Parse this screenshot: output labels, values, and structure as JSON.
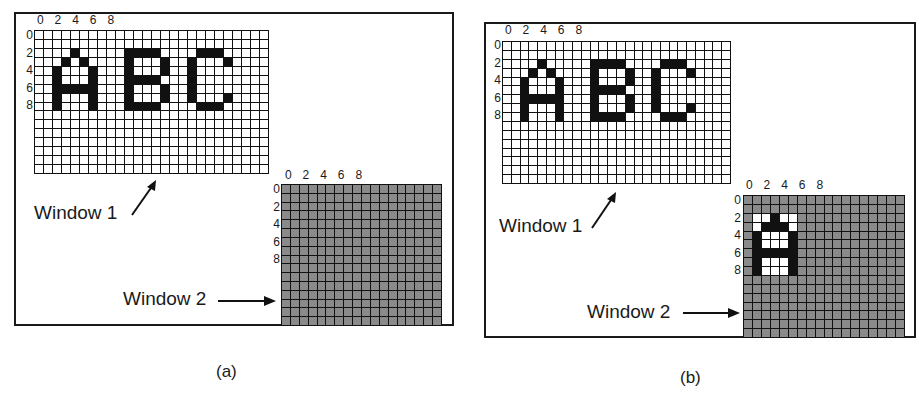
{
  "figure": {
    "panels": [
      {
        "id": "a",
        "caption": "(a)",
        "window1": {
          "label": "Window 1",
          "rows": 16,
          "cols": 26,
          "cell_color": "#ffffff",
          "x_ticks": [
            "0",
            "2",
            "4",
            "6",
            "8"
          ],
          "y_ticks": [
            "0",
            "2",
            "4",
            "6",
            "8"
          ],
          "text_shown": "ABC"
        },
        "window2": {
          "label": "Window 2",
          "rows": 16,
          "cols": 18,
          "cell_color": "#8a8a8a",
          "x_ticks": [
            "0",
            "2",
            "4",
            "6",
            "8"
          ],
          "y_ticks": [
            "0",
            "2",
            "4",
            "6",
            "8"
          ],
          "text_shown": ""
        }
      },
      {
        "id": "b",
        "caption": "(b)",
        "window1": {
          "label": "Window 1",
          "rows": 16,
          "cols": 26,
          "cell_color": "#ffffff",
          "x_ticks": [
            "0",
            "2",
            "4",
            "6",
            "8"
          ],
          "y_ticks": [
            "0",
            "2",
            "4",
            "6",
            "8"
          ],
          "text_shown": "ABC"
        },
        "window2": {
          "label": "Window 2",
          "rows": 16,
          "cols": 18,
          "cell_color": "#8a8a8a",
          "x_ticks": [
            "0",
            "2",
            "4",
            "6",
            "8"
          ],
          "y_ticks": [
            "0",
            "2",
            "4",
            "6",
            "8"
          ],
          "text_shown": "A"
        }
      }
    ],
    "glyphs": {
      "ABC_black_cells": [
        [
          2,
          4
        ],
        [
          3,
          3
        ],
        [
          3,
          5
        ],
        [
          4,
          2
        ],
        [
          4,
          6
        ],
        [
          5,
          2
        ],
        [
          5,
          6
        ],
        [
          6,
          2
        ],
        [
          6,
          3
        ],
        [
          6,
          4
        ],
        [
          6,
          5
        ],
        [
          6,
          6
        ],
        [
          7,
          2
        ],
        [
          7,
          6
        ],
        [
          8,
          2
        ],
        [
          8,
          6
        ],
        [
          2,
          10
        ],
        [
          2,
          11
        ],
        [
          2,
          12
        ],
        [
          2,
          13
        ],
        [
          3,
          10
        ],
        [
          3,
          14
        ],
        [
          4,
          10
        ],
        [
          4,
          14
        ],
        [
          5,
          10
        ],
        [
          5,
          11
        ],
        [
          5,
          12
        ],
        [
          5,
          13
        ],
        [
          6,
          10
        ],
        [
          6,
          14
        ],
        [
          7,
          10
        ],
        [
          7,
          14
        ],
        [
          8,
          10
        ],
        [
          8,
          11
        ],
        [
          8,
          12
        ],
        [
          8,
          13
        ],
        [
          2,
          18
        ],
        [
          2,
          19
        ],
        [
          2,
          20
        ],
        [
          3,
          17
        ],
        [
          3,
          21
        ],
        [
          4,
          17
        ],
        [
          5,
          17
        ],
        [
          6,
          17
        ],
        [
          7,
          17
        ],
        [
          7,
          21
        ],
        [
          8,
          18
        ],
        [
          8,
          19
        ],
        [
          8,
          20
        ]
      ],
      "A_window2_black_cells": [
        [
          2,
          3
        ],
        [
          3,
          2
        ],
        [
          3,
          3
        ],
        [
          3,
          4
        ],
        [
          4,
          1
        ],
        [
          4,
          5
        ],
        [
          5,
          1
        ],
        [
          5,
          5
        ],
        [
          6,
          1
        ],
        [
          6,
          2
        ],
        [
          6,
          3
        ],
        [
          6,
          4
        ],
        [
          6,
          5
        ],
        [
          7,
          1
        ],
        [
          7,
          5
        ],
        [
          8,
          1
        ],
        [
          8,
          5
        ]
      ],
      "A_window2_white_cells": [
        [
          2,
          1
        ],
        [
          2,
          2
        ],
        [
          2,
          4
        ],
        [
          2,
          5
        ],
        [
          3,
          1
        ],
        [
          3,
          5
        ],
        [
          4,
          2
        ],
        [
          4,
          3
        ],
        [
          4,
          4
        ],
        [
          5,
          2
        ],
        [
          5,
          3
        ],
        [
          5,
          4
        ],
        [
          7,
          2
        ],
        [
          7,
          3
        ],
        [
          7,
          4
        ],
        [
          8,
          2
        ],
        [
          8,
          3
        ],
        [
          8,
          4
        ]
      ]
    },
    "colors": {
      "ink": "#111111",
      "grey_cell": "#8a8a8a",
      "white_cell": "#ffffff"
    }
  }
}
